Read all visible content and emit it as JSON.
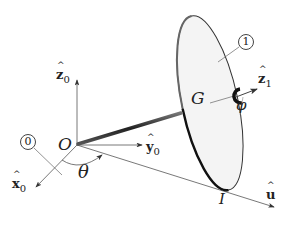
{
  "diagram": {
    "type": "rigid body kinematics - rolling disk on rod",
    "labels": {
      "origin": "O",
      "center": "G",
      "contact_point": "I",
      "angle_theta": "θ",
      "angle_phi": "φ",
      "body_0": "0",
      "body_1": "1"
    },
    "vectors": {
      "z0": {
        "letter": "z",
        "sub": "0"
      },
      "y0": {
        "letter": "y",
        "sub": "0"
      },
      "x0": {
        "letter": "x",
        "sub": "0"
      },
      "z1": {
        "letter": "z",
        "sub": "1"
      },
      "u": {
        "letter": "u",
        "sub": ""
      }
    },
    "colors": {
      "line": "#555555",
      "rod": "#333333",
      "disk_fill": "#f4f4f4",
      "disk_edge": "#222222",
      "text": "#222222"
    }
  }
}
